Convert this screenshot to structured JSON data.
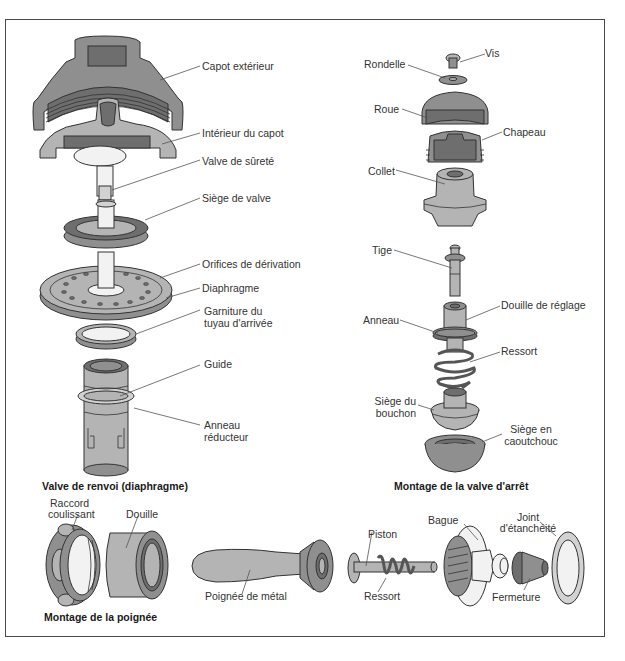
{
  "diagram": {
    "colors": {
      "frame": "#4a4a4a",
      "dark": "#6e6e6e",
      "mid": "#8f8f8f",
      "light": "#b4b4b4",
      "pale": "#d2d2d2",
      "line": "#333333",
      "leader": "#555555"
    },
    "sections": {
      "diaphragm_valve": {
        "title": "Valve de renvoi (diaphragme)",
        "labels": {
          "capot_exterieur": "Capot extérieur",
          "interieur_capot": "Intérieur du capot",
          "valve_surete": "Valve de sûreté",
          "siege_valve": "Siège de valve",
          "orifices": "Orifices de dérivation",
          "diaphragme": "Diaphragme",
          "garniture_1": "Garniture du",
          "garniture_2": "tuyau d'arrivée",
          "guide": "Guide",
          "anneau_red_1": "Anneau",
          "anneau_red_2": "réducteur"
        }
      },
      "stop_valve": {
        "title": "Montage de la valve d'arrêt",
        "labels": {
          "vis": "Vis",
          "rondelle": "Rondelle",
          "roue": "Roue",
          "chapeau": "Chapeau",
          "collet": "Collet",
          "tige": "Tige",
          "douille_reglage": "Douille de réglage",
          "anneau": "Anneau",
          "ressort": "Ressort",
          "siege_bouchon_1": "Siège du",
          "siege_bouchon_2": "bouchon",
          "siege_caout_1": "Siège en",
          "siege_caout_2": "caoutchouc"
        }
      },
      "handle": {
        "title": "Montage de la poignée",
        "labels": {
          "raccord_1": "Raccord",
          "raccord_2": "coulissant",
          "douille": "Douille",
          "poignee": "Poignée de métal",
          "piston": "Piston",
          "ressort": "Ressort",
          "bague": "Bague",
          "joint_1": "Joint",
          "joint_2": "d'étanchéité",
          "fermeture": "Fermeture"
        }
      }
    }
  }
}
